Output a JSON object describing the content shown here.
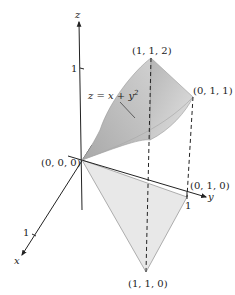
{
  "figure": {
    "axes": {
      "x_label": "x",
      "y_label": "y",
      "z_label": "z",
      "x_tick": "1",
      "y_tick": "1",
      "z_tick": "1"
    },
    "surface": {
      "equation_lhs": "z = x + y",
      "equation_exp": "2"
    },
    "points": {
      "origin": "(0, 0, 0)",
      "p112": "(1, 1, 2)",
      "p011": "(0, 1, 1)",
      "p010": "(0, 1, 0)",
      "p110": "(1, 1, 0)"
    },
    "colors": {
      "surface_dark": "#9e9e9e",
      "surface_light": "#dcdcdc",
      "base_triangle": "#e6e6e6",
      "axis": "#222222"
    }
  }
}
